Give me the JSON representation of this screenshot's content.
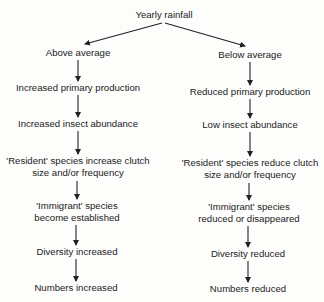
{
  "root": {
    "label": "Yearly rainfall"
  },
  "branches": [
    {
      "label": "Above average",
      "steps": [
        [
          "Increased primary production"
        ],
        [
          "Increased insect abundance"
        ],
        [
          "'Resident' species increase clutch",
          "size and/or frequency"
        ],
        [
          "'Immigrant' species",
          "become established"
        ],
        [
          "Diversity increased"
        ],
        [
          "Numbers increased"
        ]
      ]
    },
    {
      "label": "Below average",
      "steps": [
        [
          "Reduced primary production"
        ],
        [
          "Low insect abundance"
        ],
        [
          "'Resident' species reduce clutch",
          "size and/or frequency"
        ],
        [
          "'Immigrant' species",
          "reduced or disappeared"
        ],
        [
          "Diversity reduced"
        ],
        [
          "Numbers reduced"
        ]
      ]
    }
  ]
}
